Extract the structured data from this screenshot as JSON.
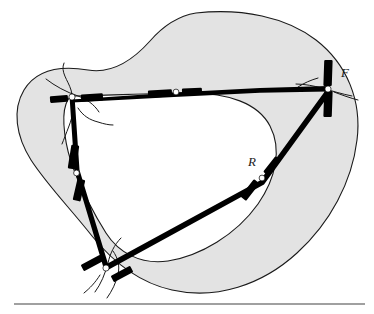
{
  "figure": {
    "type": "topological-diagram",
    "title": "",
    "background_color": "#ffffff",
    "region_fill_color": "#e3e3e3",
    "outline_color": "#1a1a1a",
    "edge_color": "#000000",
    "node_fill_color": "#ffffff",
    "rule_color": "#808080",
    "labels": [
      {
        "id": "label-F",
        "text": "F",
        "x": 345,
        "y": 74
      },
      {
        "id": "label-R",
        "text": "R",
        "x": 252,
        "y": 163
      }
    ],
    "vertices": [
      {
        "id": "vertex-left",
        "x": 72,
        "y": 96,
        "label": ""
      },
      {
        "id": "vertex-bottom",
        "x": 106,
        "y": 268,
        "label": ""
      },
      {
        "id": "vertex-right",
        "x": 328,
        "y": 89,
        "label": "F"
      }
    ],
    "edge_midpoints": [
      {
        "id": "midpoint-top",
        "x": 175,
        "y": 90,
        "label": ""
      },
      {
        "id": "midpoint-left",
        "x": 77,
        "y": 173,
        "label": ""
      },
      {
        "id": "midpoint-right-lower",
        "x": 262,
        "y": 178,
        "label": "R"
      }
    ],
    "edges": [
      {
        "id": "edge-top",
        "from": "vertex-left",
        "to": "vertex-right",
        "midpoint": "midpoint-top"
      },
      {
        "id": "edge-left",
        "from": "vertex-left",
        "to": "vertex-bottom",
        "midpoint": "midpoint-left"
      },
      {
        "id": "edge-right",
        "from": "vertex-bottom",
        "to": "vertex-right",
        "midpoint": "midpoint-right-lower"
      }
    ],
    "rule": {
      "x1": 14,
      "x2": 365,
      "y": 304
    }
  }
}
